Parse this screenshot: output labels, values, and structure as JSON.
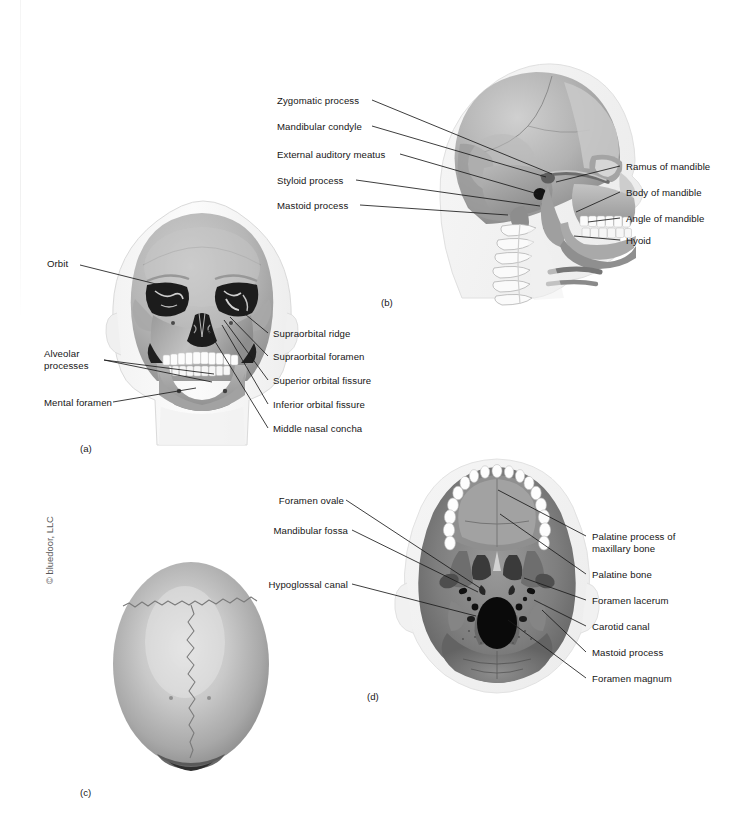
{
  "figure": {
    "background_color": "#ffffff",
    "text_color": "#161616",
    "copyright": "© bluedoor, LLC"
  },
  "panels": [
    {
      "letter": "(a)",
      "view": "anterior view of skull",
      "labels_left": [
        {
          "text": "Orbit"
        },
        {
          "text": "Alveolar\nprocesses"
        },
        {
          "text": "Mental foramen"
        }
      ],
      "labels_right": [
        {
          "text": "Supraorbital ridge"
        },
        {
          "text": "Supraorbital foramen"
        },
        {
          "text": "Superior orbital fissure"
        },
        {
          "text": "Inferior orbital fissure"
        },
        {
          "text": "Middle nasal concha"
        }
      ]
    },
    {
      "letter": "(b)",
      "view": "lateral view of skull",
      "labels_left": [
        {
          "text": "Zygomatic process"
        },
        {
          "text": "Mandibular condyle"
        },
        {
          "text": "External auditory meatus"
        },
        {
          "text": "Styloid process"
        },
        {
          "text": "Mastoid process"
        }
      ],
      "labels_right": [
        {
          "text": "Ramus of mandible"
        },
        {
          "text": "Body of mandible"
        },
        {
          "text": "Angle of mandible"
        },
        {
          "text": "Hyoid"
        }
      ]
    },
    {
      "letter": "(c)",
      "view": "superior view of cranium",
      "labels_left": [],
      "labels_right": []
    },
    {
      "letter": "(d)",
      "view": "inferior view of skull base",
      "labels_left": [
        {
          "text": "Foramen ovale"
        },
        {
          "text": "Mandibular fossa"
        },
        {
          "text": "Hypoglossal canal"
        }
      ],
      "labels_right": [
        {
          "text": "Palatine process of\nmaxillary bone"
        },
        {
          "text": "Palatine bone"
        },
        {
          "text": "Foramen lacerum"
        },
        {
          "text": "Carotid canal"
        },
        {
          "text": "Mastoid process"
        },
        {
          "text": "Foramen magnum"
        }
      ]
    }
  ]
}
